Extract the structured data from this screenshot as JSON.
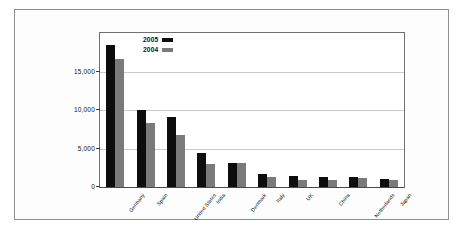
{
  "chart_data": {
    "type": "bar",
    "title": "",
    "xlabel": "",
    "ylabel": "Capacity (MW)",
    "ylim": [
      0,
      20000
    ],
    "yticks": [
      0,
      5000,
      10000,
      15000
    ],
    "ytick_labels": [
      "0",
      "5,000",
      "10,000",
      "15,000"
    ],
    "grid": true,
    "legend_position": "top-left-inside",
    "categories": [
      "Germany",
      "Spain",
      "United States",
      "India",
      "Denmark",
      "Italy",
      "UK",
      "China",
      "Netherlands",
      "Japan"
    ],
    "series": [
      {
        "name": "2005",
        "color": "#0d0d0d",
        "values": [
          18400,
          10000,
          9100,
          4400,
          3100,
          1700,
          1450,
          1350,
          1250,
          1100
        ]
      },
      {
        "name": "2004",
        "color": "#7a7a7a",
        "values": [
          16600,
          8300,
          6700,
          3000,
          3100,
          1350,
          950,
          850,
          1150,
          950
        ]
      }
    ]
  },
  "legend": {
    "entries": [
      {
        "label": "2005",
        "swatch": "black-swatch-icon"
      },
      {
        "label": "2004",
        "swatch": "gray-swatch-icon"
      }
    ]
  },
  "colors": {
    "series_2005": "#0d0d0d",
    "series_2004": "#7a7a7a",
    "gridline": "#c9c9c9",
    "axis": "#3a3a3a",
    "frame": "#8e8e8e",
    "background": "#ffffff"
  }
}
